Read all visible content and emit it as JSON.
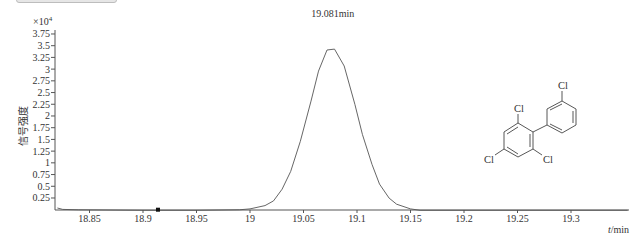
{
  "chart_data": {
    "type": "line",
    "title": "",
    "xlabel": "t/min",
    "xlabel_var": "t",
    "xlabel_unit": "/min",
    "ylabel": "信号强度",
    "y_multiplier": "×10",
    "y_multiplier_exp": "4",
    "xlim": [
      18.82,
      19.353
    ],
    "ylim": [
      0,
      3.85
    ],
    "grid": false,
    "legend": "none",
    "x_ticks": [
      18.85,
      18.9,
      18.95,
      19,
      19.05,
      19.1,
      19.15,
      19.2,
      19.25,
      19.3
    ],
    "x_tick_labels": [
      "18.85",
      "18.9",
      "18.95",
      "19",
      "19.05",
      "19.1",
      "19.15",
      "19.2",
      "19.25",
      "19.3"
    ],
    "y_ticks": [
      0.25,
      0.5,
      0.75,
      1,
      1.25,
      1.5,
      1.75,
      2,
      2.25,
      2.5,
      2.75,
      3,
      3.25,
      3.5,
      3.75
    ],
    "y_tick_labels": [
      "0.25",
      "0.5",
      "0.75",
      "1",
      "1.25",
      "1.5",
      "1.75",
      "2",
      "2.25",
      "2.5",
      "2.75",
      "3",
      "3.25",
      "3.5",
      "3.75"
    ],
    "series": [
      {
        "name": "chromatogram",
        "x": [
          18.82,
          18.825,
          18.84,
          18.9,
          18.95,
          18.99,
          19.0,
          19.014,
          19.022,
          19.03,
          19.038,
          19.047,
          19.057,
          19.064,
          19.072,
          19.079,
          19.088,
          19.098,
          19.105,
          19.114,
          19.121,
          19.13,
          19.137,
          19.15,
          19.159,
          19.353
        ],
        "values": [
          0.05,
          0.02,
          0.01,
          0.0,
          0.0,
          0.01,
          0.03,
          0.1,
          0.2,
          0.45,
          0.83,
          1.47,
          2.33,
          2.97,
          3.42,
          3.44,
          3.08,
          2.26,
          1.62,
          0.98,
          0.56,
          0.26,
          0.13,
          0.03,
          0.0,
          0.0
        ]
      }
    ],
    "annotations": [
      {
        "text": "19.081min",
        "x": 19.081,
        "y": 3.44,
        "type": "peak-label"
      }
    ],
    "marker": {
      "x": 18.914,
      "y": 0
    }
  },
  "molecule": {
    "labels": [
      "Cl",
      "Cl",
      "Cl",
      "Cl"
    ]
  }
}
